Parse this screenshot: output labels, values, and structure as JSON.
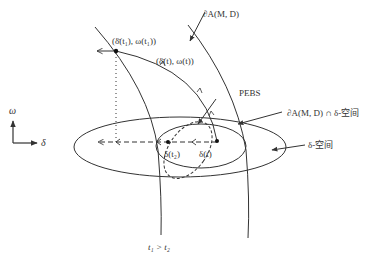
{
  "axes": {
    "vertical_label": "ω",
    "horizontal_label": "δ"
  },
  "labels": {
    "point_t1": "(δ̄(t₁), ω(t₁))",
    "point_t": "(δ̄(t), ω(t))",
    "boundary": "∂A(M, D)",
    "pebs": "PEBS",
    "intersection": "∂A(M, D) ∩ δ-空间",
    "delta_space": "δ-空间",
    "delta_t2": "δ(t₂)",
    "delta_t": "δ(t)",
    "time_relation": "t₁ > t₂"
  },
  "colors": {
    "stroke": "#333333",
    "background": "#ffffff"
  }
}
